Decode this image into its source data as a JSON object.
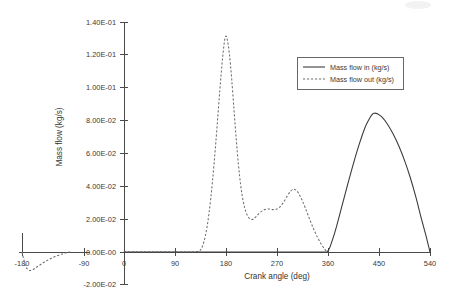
{
  "chart_data": {
    "type": "line",
    "title": "",
    "xlabel": "Crank angle (deg)",
    "ylabel": "Mass flow (kg/s)",
    "xlim": [
      0,
      540
    ],
    "ylim": [
      -0.02,
      0.14
    ],
    "grid": false,
    "legend_position": "upper-right",
    "xticks": [
      0,
      90,
      180,
      270,
      360,
      450,
      540
    ],
    "xtick_labels": [
      "0",
      "90",
      "180",
      "270",
      "360",
      "450",
      "540"
    ],
    "yticks": [
      -0.02,
      0.0,
      0.02,
      0.04,
      0.06,
      0.08,
      0.1,
      0.12,
      0.14
    ],
    "ytick_labels": [
      "-2.00E-02",
      "0.00E-00",
      "2.00E-02",
      "4.00E-02",
      "6.00E-02",
      "8.00E-02",
      "1.00E-01",
      "1.20E-01",
      "1.40E-01"
    ],
    "secondary_axis": {
      "name": "left-detached-axis",
      "xticks": [
        -180,
        -90
      ],
      "xtick_labels": [
        "-180",
        "-90"
      ]
    },
    "series": [
      {
        "name": "Mass flow in (kg/s)",
        "style": "solid",
        "color": "#3c3c3c",
        "x": [
          0,
          90,
          180,
          270,
          330,
          350,
          356,
          358,
          362,
          368,
          375,
          385,
          395,
          405,
          415,
          425,
          432,
          438,
          442,
          448,
          455,
          465,
          475,
          485,
          495,
          505,
          515,
          525,
          533,
          538,
          540
        ],
        "y": [
          0,
          0,
          0,
          0,
          0,
          0,
          0,
          0,
          0.0018,
          0.0075,
          0.0155,
          0.0285,
          0.0415,
          0.054,
          0.0655,
          0.0755,
          0.0805,
          0.0838,
          0.0845,
          0.084,
          0.0822,
          0.0778,
          0.0718,
          0.0645,
          0.0558,
          0.0455,
          0.0335,
          0.02,
          0.0098,
          0.0028,
          0
        ]
      },
      {
        "name": "Mass flow out (kg/s)",
        "style": "dashed",
        "color": "#6e6e6e",
        "x": [
          0,
          90,
          120,
          132,
          138,
          144,
          150,
          156,
          162,
          168,
          172,
          176,
          179,
          182,
          186,
          190,
          194,
          198,
          202,
          206,
          210,
          215,
          220,
          225,
          228,
          233,
          240,
          248,
          256,
          263,
          270,
          276,
          282,
          288,
          294,
          299,
          303,
          308,
          314,
          320,
          327,
          334,
          341,
          348,
          354,
          358,
          360
        ],
        "y": [
          0,
          0,
          0,
          0.0005,
          0.0032,
          0.0105,
          0.0235,
          0.0425,
          0.0665,
          0.0935,
          0.1105,
          0.1248,
          0.131,
          0.1298,
          0.1205,
          0.1055,
          0.087,
          0.069,
          0.053,
          0.0405,
          0.0315,
          0.0245,
          0.021,
          0.0198,
          0.02,
          0.0215,
          0.024,
          0.0258,
          0.0262,
          0.0258,
          0.0262,
          0.0278,
          0.0305,
          0.034,
          0.037,
          0.0382,
          0.0378,
          0.0358,
          0.0318,
          0.0268,
          0.0205,
          0.0145,
          0.0092,
          0.0048,
          0.0018,
          0.0003,
          0
        ]
      },
      {
        "name": "Mass flow out (kg/s) left segment",
        "style": "dashed",
        "color": "#6e6e6e",
        "axis": "secondary",
        "x": [
          -180,
          -178,
          -175,
          -172,
          -169,
          -166,
          -162,
          -158,
          -153,
          -148,
          -142,
          -136,
          -130,
          -124,
          -120,
          -116,
          -113,
          -111,
          -110
        ],
        "y": [
          0,
          -0.0035,
          -0.0082,
          -0.0105,
          -0.0112,
          -0.011,
          -0.0102,
          -0.009,
          -0.0076,
          -0.0062,
          -0.0048,
          -0.0035,
          -0.0024,
          -0.0015,
          -0.001,
          -0.0005,
          -0.0002,
          0,
          0
        ]
      }
    ],
    "annotations": [
      {
        "name": "left-vertical-marker",
        "x": -180,
        "y_from": 0,
        "y_to": 0.0115,
        "style": "solid"
      }
    ]
  },
  "legend": {
    "items": [
      {
        "label": "Mass flow in (kg/s)",
        "style": "solid"
      },
      {
        "label": "Mass flow out (kg/s)",
        "style": "dashed"
      }
    ]
  },
  "axes": {
    "y_title": "Mass flow (kg/s)",
    "x_title": "Crank angle (deg)"
  },
  "colors": {
    "series_in": "#3c3c3c",
    "series_out": "#6e6e6e",
    "axis": "#4a4a4a",
    "text": "#3a3a3a",
    "background": "#ffffff"
  }
}
